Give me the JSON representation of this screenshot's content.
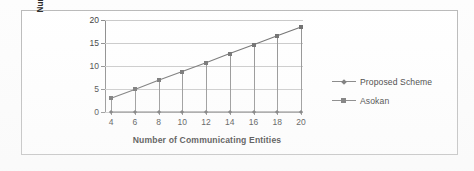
{
  "figure": {
    "border_color": "#b9b9b9",
    "background": "#ffffff"
  },
  "chart_data": {
    "type": "line",
    "title": "",
    "xlabel": "Number of Communicating Entities",
    "ylabel": "Number of Contacts with DTNNA",
    "ylabel_line1": "Number of Contacts with",
    "ylabel_line2": "DTNNA",
    "x": [
      4,
      6,
      8,
      10,
      12,
      14,
      16,
      18,
      20
    ],
    "xtick_labels": [
      "4",
      "6",
      "8",
      "10",
      "12",
      "14",
      "16",
      "18",
      "20"
    ],
    "ytick_labels": [
      "0",
      "5",
      "10",
      "15",
      "20"
    ],
    "yticks": [
      0,
      5,
      10,
      15,
      20
    ],
    "ylim": [
      0,
      20
    ],
    "xlim": [
      4,
      20
    ],
    "grid": true,
    "legend_position": "right",
    "series": [
      {
        "name": "Proposed Scheme",
        "marker": "diamond",
        "color": "#6b6b6b",
        "values": [
          0,
          0,
          0,
          0,
          0,
          0,
          0,
          0,
          0
        ]
      },
      {
        "name": "Asokan",
        "marker": "square",
        "color": "#6b6b6b",
        "values": [
          3.0,
          4.9,
          6.9,
          8.8,
          10.7,
          12.7,
          14.6,
          16.6,
          18.5
        ]
      }
    ]
  },
  "legend": {
    "items": [
      {
        "label": "Proposed Scheme",
        "marker": "diamond"
      },
      {
        "label": "Asokan",
        "marker": "square"
      }
    ]
  }
}
